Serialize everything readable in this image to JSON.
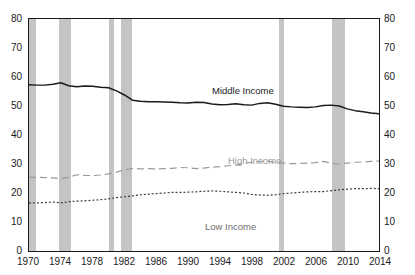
{
  "chart_data": {
    "type": "line",
    "title": "",
    "xlabel": "",
    "ylabel": "",
    "xlim": [
      1970,
      2014
    ],
    "ylim": [
      0,
      80
    ],
    "ytick_labels": [
      "0",
      "10",
      "20",
      "30",
      "40",
      "50",
      "60",
      "70",
      "80"
    ],
    "ytick_values": [
      0,
      10,
      20,
      30,
      40,
      50,
      60,
      70,
      80
    ],
    "ytick_axes": [
      "left",
      "right"
    ],
    "xtick_labels": [
      "1970",
      "1974",
      "1978",
      "1982",
      "1986",
      "1990",
      "1994",
      "1998",
      "2002",
      "2006",
      "2010",
      "2014"
    ],
    "xtick_values": [
      1970,
      1974,
      1978,
      1982,
      1986,
      1990,
      1994,
      1998,
      2002,
      2006,
      2010,
      2014
    ],
    "grid": false,
    "legend_position": "inline-annotations",
    "x": [
      1970,
      1971,
      1972,
      1973,
      1974,
      1975,
      1976,
      1977,
      1978,
      1979,
      1980,
      1981,
      1982,
      1983,
      1984,
      1985,
      1986,
      1987,
      1988,
      1989,
      1990,
      1991,
      1992,
      1993,
      1994,
      1995,
      1996,
      1997,
      1998,
      1999,
      2000,
      2001,
      2002,
      2003,
      2004,
      2005,
      2006,
      2007,
      2008,
      2009,
      2010,
      2011,
      2012,
      2013,
      2014
    ],
    "series": [
      {
        "name": "Middle Income",
        "style": "solid",
        "color": "#1a1a1a",
        "label_x": 1992,
        "label_y": 62,
        "values": [
          57.3,
          57.2,
          57.2,
          57.5,
          58.0,
          57.0,
          56.6,
          56.9,
          56.8,
          56.5,
          56.3,
          55.2,
          53.8,
          52.0,
          51.6,
          51.5,
          51.5,
          51.4,
          51.3,
          51.1,
          51.0,
          51.3,
          51.2,
          50.7,
          50.4,
          50.5,
          50.8,
          50.4,
          50.3,
          50.9,
          51.1,
          50.6,
          49.9,
          49.7,
          49.6,
          49.5,
          49.7,
          50.2,
          50.3,
          50.0,
          49.0,
          48.4,
          48.0,
          47.6,
          47.3
        ]
      },
      {
        "name": "High Income",
        "style": "dashed",
        "color": "#9a9a9a",
        "label_x": 1996,
        "label_y": 33,
        "values": [
          25.5,
          25.4,
          25.3,
          25.2,
          25.0,
          25.4,
          26.3,
          26.1,
          26.0,
          26.2,
          26.6,
          27.2,
          28.0,
          28.5,
          28.3,
          28.4,
          28.3,
          28.4,
          28.5,
          28.8,
          28.7,
          28.4,
          28.6,
          28.9,
          29.1,
          29.4,
          29.6,
          30.2,
          30.6,
          30.8,
          31.0,
          30.5,
          30.3,
          30.1,
          30.2,
          30.3,
          30.5,
          30.9,
          30.3,
          30.0,
          30.3,
          30.6,
          30.7,
          30.9,
          31.0
        ]
      },
      {
        "name": "Low Income",
        "style": "dotted",
        "color": "#3a3a3a",
        "label_x": 1990,
        "label_y": 15,
        "values": [
          16.5,
          16.6,
          16.7,
          16.9,
          16.6,
          17.0,
          17.2,
          17.3,
          17.5,
          17.7,
          18.0,
          18.4,
          18.7,
          19.0,
          19.4,
          19.6,
          19.8,
          20.0,
          20.2,
          20.2,
          20.3,
          20.4,
          20.6,
          20.7,
          20.6,
          20.4,
          20.2,
          20.0,
          19.5,
          19.3,
          19.2,
          19.4,
          19.8,
          20.0,
          20.2,
          20.4,
          20.5,
          20.5,
          20.8,
          21.1,
          21.3,
          21.5,
          21.5,
          21.6,
          21.5
        ]
      }
    ],
    "shaded_regions": {
      "label": "recession",
      "color": "#c4c4c4",
      "spans": [
        [
          1969.9,
          1970.9
        ],
        [
          1973.8,
          1975.2
        ],
        [
          1980.0,
          1980.6
        ],
        [
          1981.5,
          1982.9
        ],
        [
          2001.2,
          2001.9
        ],
        [
          2007.9,
          2009.5
        ]
      ]
    }
  }
}
